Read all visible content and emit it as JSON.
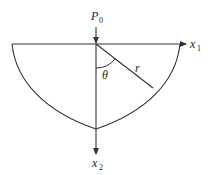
{
  "diagram": {
    "title": "",
    "labels": {
      "load": {
        "base": "P",
        "sub": "0"
      },
      "x_axis": {
        "base": "x",
        "sub": "1"
      },
      "y_axis": {
        "base": "x",
        "sub": "2"
      },
      "angle": "θ",
      "radius": "r"
    },
    "colors": {
      "stroke": "#333333",
      "background": "#ffffff"
    }
  }
}
